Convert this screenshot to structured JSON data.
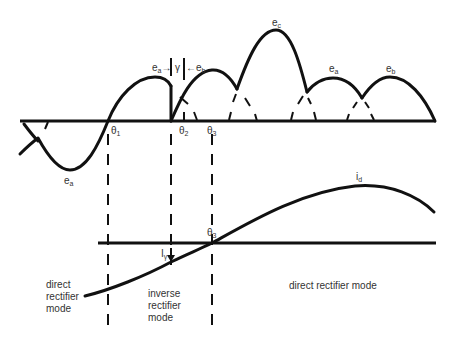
{
  "diagram": {
    "type": "rectifier commutation waveform diagram",
    "colors": {
      "line": "#111111",
      "text": "#333333",
      "background": "#ffffff"
    },
    "top_plot": {
      "voltage_labels": [
        {
          "id": "ea_neg",
          "base": "e",
          "sub": "a"
        },
        {
          "id": "ea_top",
          "base": "e",
          "sub": "a"
        },
        {
          "id": "eb_top",
          "base": "e",
          "sub": "b"
        },
        {
          "id": "ec_top",
          "base": "e",
          "sub": "c"
        },
        {
          "id": "ea_right",
          "base": "e",
          "sub": "a"
        },
        {
          "id": "eb_right",
          "base": "e",
          "sub": "b"
        }
      ],
      "commutation_annotation": {
        "left": {
          "base": "e",
          "sub": "a",
          "arrow": "→"
        },
        "gamma": "γ",
        "right": {
          "base": "e",
          "sub": "b",
          "arrow": "←"
        }
      },
      "angle_labels": [
        {
          "base": "θ",
          "sub": "1"
        },
        {
          "base": "θ",
          "sub": "2"
        },
        {
          "base": "θ",
          "sub": "3"
        }
      ]
    },
    "bottom_plot": {
      "current_label": {
        "base": "i",
        "sub": "d"
      },
      "gamma_current_label": {
        "base": "I",
        "sub": "γ"
      },
      "crossing_label": {
        "base": "θ",
        "sub": "3"
      },
      "modes": [
        {
          "lines": [
            "direct",
            "rectifier",
            "mode"
          ]
        },
        {
          "lines": [
            "inverse",
            "rectifier",
            "mode"
          ]
        },
        {
          "lines": [
            "direct rectifier mode"
          ]
        }
      ]
    }
  }
}
